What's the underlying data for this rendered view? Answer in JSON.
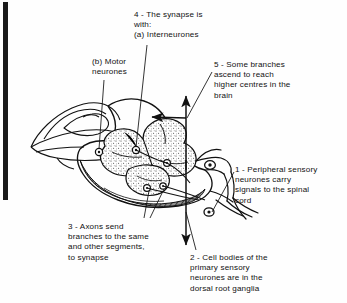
{
  "figure": {
    "background_color": "#fefefe",
    "ink_color": "#111111",
    "grey_matter_fill": "#ffffff",
    "stipple_color": "#333333",
    "shading_color": "#4a4a4a"
  },
  "annotations": {
    "label_4": "4 - The synapse is\nwith:\n(a)  Interneurones",
    "label_b": "(b)  Motor\nneurones",
    "label_5": "5 - Some branches\nascend to reach\nhigher centres in the\nbrain",
    "label_1": "1 - Peripheral sensory\nneurones carry\nsignals to the spinal\ncord",
    "label_3": "3 - Axons send\nbranches to the same\nand other segments,\nto synapse",
    "label_2": "2 - Cell bodies of the\nprimary sensory\nneurones are in the\ndorsal root ganglia"
  },
  "diagram_parts": {
    "spinal_cord_section": "spinal cord cross-section",
    "grey_matter": "butterfly-shaped grey matter",
    "dorsal_horn": "dorsal horn",
    "ventral_horn": "ventral horn",
    "dura_flap": "cut dura mater flap",
    "dorsal_root": "dorsal root",
    "ventral_root": "ventral root",
    "ganglion_upper": "dorsal root ganglion",
    "ganglion_lower": "dorsal root ganglion",
    "ascending_arrow": "ascending tract arrow",
    "descending_arrow": "descending tract arrow",
    "entry_arrow": "sensory entry arrow",
    "synapse_nodes": "synapse points"
  }
}
